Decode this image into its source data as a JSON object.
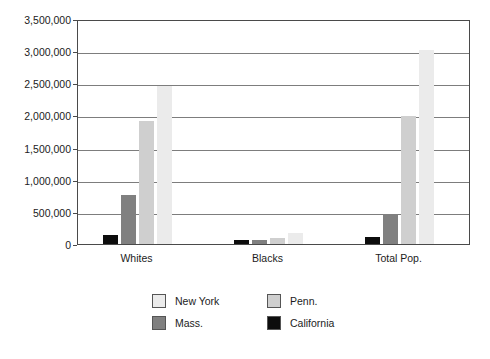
{
  "chart_data": {
    "type": "bar",
    "title": "",
    "xlabel": "",
    "ylabel": "",
    "categories": [
      "Whites",
      "Blacks",
      "Total Pop."
    ],
    "series": [
      {
        "name": "California",
        "color": "#0d0d0d",
        "values": [
          140000,
          60000,
          105000
        ]
      },
      {
        "name": "Mass.",
        "color": "#808080",
        "values": [
          755000,
          65000,
          470000
        ]
      },
      {
        "name": "Penn.",
        "color": "#cfcfcf",
        "values": [
          1910000,
          95000,
          1990000
        ]
      },
      {
        "name": "New York",
        "color": "#ebebeb",
        "values": [
          2460000,
          170000,
          3020000
        ]
      }
    ],
    "ylim": [
      0,
      3500000
    ],
    "ytick_step": 500000,
    "yticks": [
      "3,500,000",
      "3,000,000",
      "2,500,000",
      "2,000,000",
      "1,500,000",
      "1,000,000",
      "500,000",
      "0"
    ],
    "grid": true,
    "legend_position": "bottom",
    "legend": [
      {
        "label": "New York",
        "color": "#ebebeb"
      },
      {
        "label": "Penn.",
        "color": "#cfcfcf"
      },
      {
        "label": "Mass.",
        "color": "#808080"
      },
      {
        "label": "California",
        "color": "#0d0d0d"
      }
    ]
  }
}
